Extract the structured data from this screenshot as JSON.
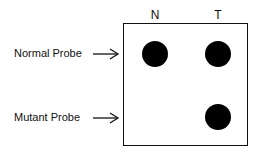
{
  "columns": [
    {
      "label": "N"
    },
    {
      "label": "T"
    }
  ],
  "rows": [
    {
      "label": "Normal Probe"
    },
    {
      "label": "Mutant Probe"
    }
  ],
  "dots": [
    {
      "row": "Normal Probe",
      "column": "N",
      "present": true
    },
    {
      "row": "Normal Probe",
      "column": "T",
      "present": true
    },
    {
      "row": "Mutant Probe",
      "column": "N",
      "present": false
    },
    {
      "row": "Mutant Probe",
      "column": "T",
      "present": true
    }
  ],
  "colors": {
    "dot": "#000000",
    "border": "#111111"
  }
}
